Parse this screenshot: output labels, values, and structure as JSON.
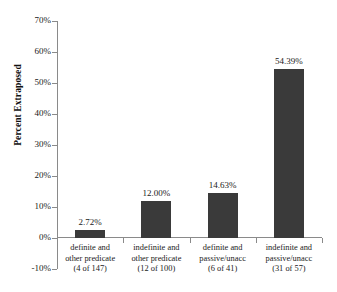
{
  "chart_data": {
    "type": "bar",
    "title": "",
    "xlabel": "",
    "ylabel": "Percent Extraposed",
    "ylim": [
      -10,
      70
    ],
    "ytick_step": 10,
    "grid": false,
    "legend": "none",
    "bar_color": "#3a3a3a",
    "axis_color": "#8a8a8a",
    "background_color": "#ffffff",
    "categories": [
      "definite and other predicate (4 of 147)",
      "indefinite and other predicate (12 of 100)",
      "definite and passive/unacc (6 of 41)",
      "indefinite and passive/unacc (31 of 57)"
    ],
    "values": [
      2.72,
      12.0,
      14.63,
      54.39
    ],
    "value_labels": [
      "2.72%",
      "12.00%",
      "14.63%",
      "54.39%"
    ],
    "ytick_labels": [
      "70%",
      "60%",
      "50%",
      "40%",
      "30%",
      "20%",
      "10%",
      "0%",
      "-10%"
    ],
    "ytick_values": [
      70,
      60,
      50,
      40,
      30,
      20,
      10,
      0,
      -10
    ],
    "category_lines": [
      [
        "definite and",
        "other predicate",
        "(4 of 147)"
      ],
      [
        "indefinite and",
        "other predicate",
        "(12 of 100)"
      ],
      [
        "definite and",
        "passive/unacc",
        "(6 of 41)"
      ],
      [
        "indefinite and",
        "passive/unacc",
        "(31 of 57)"
      ]
    ]
  }
}
